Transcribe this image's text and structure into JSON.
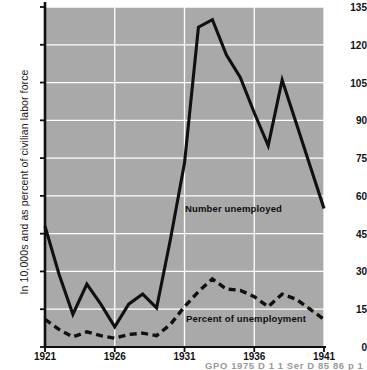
{
  "chart_data": {
    "type": "line",
    "title": "",
    "xlabel": "",
    "ylabel": "In 10,000s and as percent of civilian labor force",
    "xlim": [
      1921,
      1941
    ],
    "ylim": [
      0,
      135
    ],
    "grid": true,
    "legend": "inline-annotations",
    "plot_background": "#a9a9a9",
    "gridline_color": "#ffffff",
    "line_color": "#101010",
    "x": [
      1921,
      1922,
      1923,
      1924,
      1925,
      1926,
      1927,
      1928,
      1929,
      1930,
      1931,
      1932,
      1933,
      1934,
      1935,
      1936,
      1937,
      1938,
      1939,
      1940,
      1941
    ],
    "xticks": [
      1921,
      1926,
      1931,
      1936,
      1941
    ],
    "xtick_labels": [
      "1921",
      "1926",
      "1931",
      "1936",
      "1941"
    ],
    "yticks": [
      0,
      15,
      30,
      45,
      60,
      75,
      90,
      105,
      120,
      135
    ],
    "ytick_labels": [
      "0",
      "15",
      "30",
      "45",
      "60",
      "75",
      "90",
      "105",
      "120",
      "135"
    ],
    "series": [
      {
        "name": "Number unemployed",
        "style": "solid",
        "label_text": "Number unemployed",
        "values": [
          48,
          29,
          13,
          25,
          17,
          8,
          17,
          21,
          15.5,
          43,
          73,
          127,
          130,
          116,
          107,
          93,
          80,
          106,
          89,
          72,
          55
        ]
      },
      {
        "name": "Percent of unemployment",
        "style": "dashed",
        "label_text": "Percent of unemployment",
        "values": [
          11,
          7,
          4,
          6,
          4.5,
          3.5,
          5,
          5.5,
          4.5,
          9,
          16,
          22,
          27,
          23,
          22.5,
          20,
          16,
          21,
          19,
          15,
          11
        ]
      }
    ]
  },
  "annotations": {
    "number_unemployed_label": "Number unemployed",
    "percent_unemployment_label": "Percent of unemployment"
  },
  "footnote": {
    "text": "GPO  1975  D 1 1  Ser  D 85  86  p 1"
  }
}
